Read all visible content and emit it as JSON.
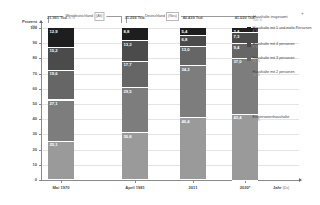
{
  "chart_data": {
    "type": "bar",
    "stacked": true,
    "xlabel": "Jahr",
    "xlabel_unit": "(Ds)",
    "ylabel": "Prozent",
    "ylabel_unit": "(%)",
    "ylim": [
      0,
      100
    ],
    "grid": true,
    "legend_position": "right",
    "categories": [
      "Mai 1970",
      "April 1981",
      "2011",
      "2030*"
    ],
    "totals": [
      "21.991 Tsd.",
      "31.256 Tsd.",
      "40.439 Tsd.",
      "41.020 Tsd."
    ],
    "total_notes": [
      "in %",
      "",
      "",
      ""
    ],
    "series": [
      {
        "name": "Einpersonenhaushalte",
        "share": "39 %",
        "color": "#9a9a9a",
        "values": [
          25.1,
          30.8,
          40.4,
          43.4
        ]
      },
      {
        "name": "Haushalte mit 2 personen",
        "share": "35 %",
        "color": "#7d7d7d",
        "values": [
          27.1,
          29.5,
          34.3,
          37.0
        ]
      },
      {
        "name": "Haushalte mit 3 personen",
        "share": "13 %",
        "color": "#666666",
        "values": [
          19.6,
          17.7,
          13.0,
          9.4
        ]
      },
      {
        "name": "Haushalte mit 4 personen",
        "share": "9 %",
        "color": "#4b4b4b",
        "values": [
          15.2,
          13.3,
          6.8,
          7.3
        ]
      },
      {
        "name": "Haushalte mit 5 und mehr Personen",
        "share": "4 %",
        "color": "#1e1e1e",
        "values": [
          12.9,
          8.8,
          5.4,
          3.4
        ]
      }
    ],
    "legend_title": "Haushalte insgesamt",
    "legend_title_share": "100 %",
    "group_headers": [
      {
        "label": "Westdeutschland",
        "tag": "(Alt)",
        "span": [
          1,
          2
        ]
      },
      {
        "label": "Deutschland",
        "tag": "(Neu)",
        "span": [
          3,
          4
        ]
      }
    ]
  }
}
